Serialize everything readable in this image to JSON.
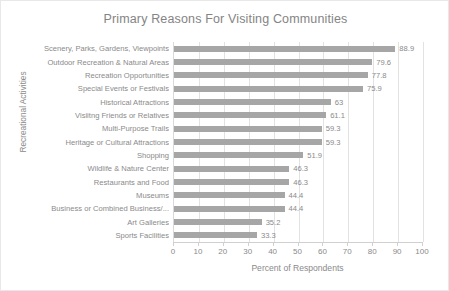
{
  "chart_data": {
    "type": "bar",
    "orientation": "horizontal",
    "title": "Primary Reasons For Visiting Communities",
    "xlabel": "Percent of Respondents",
    "ylabel": "Recreational Activities",
    "xlim": [
      0,
      100
    ],
    "xticks": [
      0,
      10,
      20,
      30,
      40,
      50,
      60,
      70,
      80,
      90,
      100
    ],
    "xtick_labels": [
      "0",
      "10",
      "20",
      "30",
      "40",
      "50",
      "60",
      "70",
      "80",
      "90",
      "100"
    ],
    "grid": "vertical",
    "legend": "none",
    "bar_color": "#a6a6a6",
    "categories": [
      "Scenery, Parks, Gardens, Viewpoints",
      "Outdoor Recreation & Natural Areas",
      "Recreation Opportunities",
      "Special Events or Festivals",
      "Historical Attractions",
      "Visiitng Friends or Relatives",
      "Multi-Purpose Trails",
      "Heritage or Cultural Attractions",
      "Shopping",
      "Wildlife & Nature Center",
      "Restaurants and Food",
      "Museums",
      "Business or Combined Business/...",
      "Art Galleries",
      "Sports Facilities"
    ],
    "values": [
      88.9,
      79.6,
      77.8,
      75.9,
      63,
      61.1,
      59.3,
      59.3,
      51.9,
      46.3,
      46.3,
      44.4,
      44.4,
      35.2,
      33.3
    ],
    "value_labels": [
      "88.9",
      "79.6",
      "77.8",
      "75.9",
      "63",
      "61.1",
      "59.3",
      "59.3",
      "51.9",
      "46.3",
      "46.3",
      "44.4",
      "44.4",
      "35.2",
      "33.3"
    ]
  }
}
